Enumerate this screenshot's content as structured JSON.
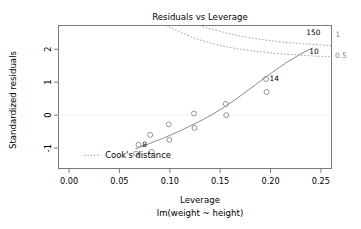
{
  "chart_data": {
    "type": "scatter",
    "title": "Residuals vs Leverage",
    "xlabel": "Leverage",
    "sublabel": "lm(weight ~ height)",
    "ylabel": "Standardized residuals",
    "xlim": [
      -0.0105,
      0.2605
    ],
    "ylim": [
      -1.62,
      2.72
    ],
    "grid": false,
    "xticks": [
      0.0,
      0.05,
      0.1,
      0.15,
      0.2,
      0.25
    ],
    "xticklabels": [
      "0.00",
      "0.05",
      "0.10",
      "0.15",
      "0.20",
      "0.25"
    ],
    "yticks": [
      -1,
      0,
      1,
      2
    ],
    "yticklabels": [
      "-1",
      "0",
      "1",
      "2"
    ],
    "points": [
      {
        "x": 0.0665,
        "y": -1.17,
        "label": ""
      },
      {
        "x": 0.069,
        "y": -0.9,
        "label": "8"
      },
      {
        "x": 0.0805,
        "y": -0.6,
        "label": ""
      },
      {
        "x": 0.082,
        "y": -1.12,
        "label": ""
      },
      {
        "x": 0.099,
        "y": -0.28,
        "label": ""
      },
      {
        "x": 0.0995,
        "y": -0.75,
        "label": ""
      },
      {
        "x": 0.124,
        "y": 0.05,
        "label": ""
      },
      {
        "x": 0.1245,
        "y": -0.39,
        "label": ""
      },
      {
        "x": 0.1555,
        "y": 0.34,
        "label": ""
      },
      {
        "x": 0.156,
        "y": 0.0,
        "label": ""
      },
      {
        "x": 0.1955,
        "y": 1.1,
        "label": "14"
      },
      {
        "x": 0.196,
        "y": 0.7,
        "label": ""
      }
    ],
    "point_labels_outside": [
      {
        "x": 0.2355,
        "y": 2.44,
        "text": "150"
      },
      {
        "x": 0.2385,
        "y": 1.87,
        "text": "10"
      }
    ],
    "smoother": {
      "name": "lowess-trend",
      "points": [
        [
          0.066,
          -1.02
        ],
        [
          0.08,
          -0.86
        ],
        [
          0.095,
          -0.68
        ],
        [
          0.11,
          -0.48
        ],
        [
          0.125,
          -0.26
        ],
        [
          0.14,
          -0.02
        ],
        [
          0.155,
          0.26
        ],
        [
          0.17,
          0.58
        ],
        [
          0.185,
          0.92
        ],
        [
          0.2,
          1.26
        ],
        [
          0.215,
          1.58
        ],
        [
          0.23,
          1.86
        ],
        [
          0.242,
          2.04
        ]
      ]
    },
    "cooks_contours": [
      {
        "level": "1",
        "label": "1",
        "label_x": 0.2585,
        "label_y": 2.45,
        "points": [
          [
            0.129,
            2.72
          ],
          [
            0.14,
            2.62
          ],
          [
            0.155,
            2.5
          ],
          [
            0.17,
            2.4
          ],
          [
            0.185,
            2.32
          ],
          [
            0.2,
            2.26
          ],
          [
            0.215,
            2.21
          ],
          [
            0.23,
            2.17
          ],
          [
            0.245,
            2.14
          ],
          [
            0.26,
            2.11
          ]
        ]
      },
      {
        "level": "0.5",
        "label": "0.5",
        "label_x": 0.258,
        "label_y": 1.83,
        "points": [
          [
            0.096,
            2.72
          ],
          [
            0.11,
            2.52
          ],
          [
            0.125,
            2.33
          ],
          [
            0.14,
            2.19
          ],
          [
            0.155,
            2.08
          ],
          [
            0.17,
            2.0
          ],
          [
            0.185,
            1.94
          ],
          [
            0.2,
            1.89
          ],
          [
            0.215,
            1.85
          ],
          [
            0.23,
            1.82
          ],
          [
            0.245,
            1.79
          ],
          [
            0.26,
            1.77
          ]
        ]
      }
    ],
    "legend": {
      "label": "Cook's distance",
      "line_style": "dotted",
      "x": 0.013,
      "y": -1.22
    },
    "colors": {
      "point": "#8a8a8a",
      "line": "#8c8c8c",
      "contour": "#9a9a9a",
      "axis": "#6e6e6e",
      "text": "#000000",
      "contour_label": "#8a8a8a",
      "background": "#ffffff"
    }
  }
}
